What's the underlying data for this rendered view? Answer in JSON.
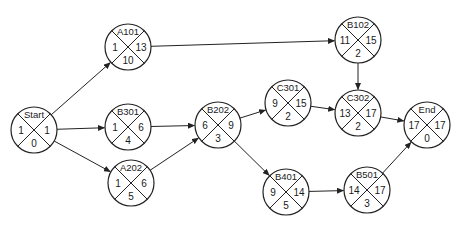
{
  "diagram": {
    "type": "activity-on-node network",
    "node_radius": 23,
    "stroke_color": "#222222",
    "nodes": [
      {
        "id": "Start",
        "cx": 34,
        "cy": 130,
        "left": "1",
        "right": "1",
        "bottom": "0"
      },
      {
        "id": "A101",
        "cx": 128,
        "cy": 47,
        "left": "1",
        "right": "13",
        "bottom": "10"
      },
      {
        "id": "B301",
        "cx": 128,
        "cy": 127,
        "left": "1",
        "right": "6",
        "bottom": "4"
      },
      {
        "id": "A202",
        "cx": 131,
        "cy": 183,
        "left": "1",
        "right": "6",
        "bottom": "5"
      },
      {
        "id": "B202",
        "cx": 218,
        "cy": 125,
        "left": "6",
        "right": "9",
        "bottom": "3"
      },
      {
        "id": "C301",
        "cx": 288,
        "cy": 103,
        "left": "9",
        "right": "15",
        "bottom": "2"
      },
      {
        "id": "B401",
        "cx": 286,
        "cy": 192,
        "left": "9",
        "right": "14",
        "bottom": "5"
      },
      {
        "id": "B102",
        "cx": 358,
        "cy": 40,
        "left": "11",
        "right": "15",
        "bottom": "2"
      },
      {
        "id": "C302",
        "cx": 358,
        "cy": 113,
        "left": "13",
        "right": "17",
        "bottom": "2"
      },
      {
        "id": "B501",
        "cx": 367,
        "cy": 190,
        "left": "14",
        "right": "17",
        "bottom": "3"
      },
      {
        "id": "End",
        "cx": 427,
        "cy": 125,
        "left": "17",
        "right": "17",
        "bottom": "0"
      }
    ],
    "edges": [
      {
        "from": "Start",
        "to": "A101"
      },
      {
        "from": "Start",
        "to": "B301"
      },
      {
        "from": "Start",
        "to": "A202"
      },
      {
        "from": "A101",
        "to": "B102"
      },
      {
        "from": "B301",
        "to": "B202"
      },
      {
        "from": "A202",
        "to": "B202"
      },
      {
        "from": "B202",
        "to": "C301"
      },
      {
        "from": "B202",
        "to": "B401"
      },
      {
        "from": "B102",
        "to": "C302"
      },
      {
        "from": "C301",
        "to": "C302"
      },
      {
        "from": "C302",
        "to": "End"
      },
      {
        "from": "B401",
        "to": "B501"
      },
      {
        "from": "B501",
        "to": "End"
      }
    ]
  }
}
